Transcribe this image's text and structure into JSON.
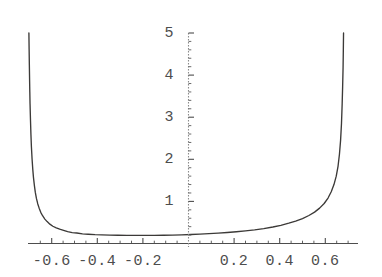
{
  "figure": {
    "background_color": "#ffffff",
    "curve_color": "#3c3a38",
    "axis_color": "#4d4d4d",
    "tick_label_color": "#4d4d4d",
    "width": 382,
    "height": 277
  },
  "chart_data": {
    "type": "line",
    "title": "",
    "xlabel": "",
    "ylabel": "",
    "grid": false,
    "legend": null,
    "xlim": [
      -0.78,
      0.76
    ],
    "ylim": [
      0,
      5.2
    ],
    "x_ticks": [
      -0.6,
      -0.4,
      -0.2,
      0.2,
      0.4,
      0.6
    ],
    "x_tick_labels": [
      "-0.6",
      "-0.4",
      "-0.2",
      "0.2",
      "0.4",
      "0.6"
    ],
    "y_ticks": [
      1,
      2,
      3,
      4,
      5
    ],
    "y_tick_labels": [
      "1",
      "2",
      "3",
      "4",
      "5"
    ],
    "x_minor_tick_step": 0.05,
    "y_minor_tick_step": 0.2,
    "annotations": [
      "left vertical asymptote near x = -0.70",
      "right vertical asymptote near x = 0.68",
      "curve clipped at top of frame y = 5",
      "broad flat minimum of about y = 0.2 between x = -0.45 and x = 0.05"
    ],
    "series": [
      {
        "name": "curve",
        "x": [
          -0.7,
          -0.699,
          -0.698,
          -0.697,
          -0.696,
          -0.695,
          -0.693,
          -0.691,
          -0.689,
          -0.686,
          -0.683,
          -0.68,
          -0.676,
          -0.672,
          -0.667,
          -0.661,
          -0.655,
          -0.648,
          -0.64,
          -0.63,
          -0.62,
          -0.608,
          -0.595,
          -0.58,
          -0.565,
          -0.548,
          -0.53,
          -0.51,
          -0.49,
          -0.465,
          -0.44,
          -0.41,
          -0.38,
          -0.345,
          -0.31,
          -0.27,
          -0.23,
          -0.19,
          -0.15,
          -0.11,
          -0.07,
          -0.03,
          0.01,
          0.05,
          0.09,
          0.13,
          0.17,
          0.21,
          0.25,
          0.29,
          0.33,
          0.37,
          0.405,
          0.44,
          0.47,
          0.5,
          0.528,
          0.553,
          0.575,
          0.595,
          0.612,
          0.626,
          0.638,
          0.648,
          0.656,
          0.662,
          0.667,
          0.671,
          0.674,
          0.676,
          0.678,
          0.679,
          0.68
        ],
        "y": [
          5.0,
          4.6,
          4.24,
          3.9,
          3.6,
          3.32,
          2.92,
          2.58,
          2.3,
          2.0,
          1.76,
          1.57,
          1.38,
          1.22,
          1.07,
          0.94,
          0.84,
          0.74,
          0.66,
          0.58,
          0.52,
          0.46,
          0.41,
          0.37,
          0.34,
          0.31,
          0.28,
          0.26,
          0.25,
          0.23,
          0.22,
          0.21,
          0.205,
          0.2,
          0.195,
          0.193,
          0.192,
          0.192,
          0.193,
          0.196,
          0.2,
          0.206,
          0.213,
          0.222,
          0.233,
          0.246,
          0.261,
          0.279,
          0.3,
          0.325,
          0.355,
          0.392,
          0.432,
          0.482,
          0.532,
          0.592,
          0.665,
          0.745,
          0.84,
          0.95,
          1.08,
          1.23,
          1.4,
          1.6,
          1.84,
          2.12,
          2.45,
          2.85,
          3.32,
          3.72,
          4.18,
          4.56,
          5.0
        ]
      }
    ]
  },
  "axes": {
    "x_axis_name": "horizontal-axis",
    "y_axis_name": "vertical-axis"
  }
}
